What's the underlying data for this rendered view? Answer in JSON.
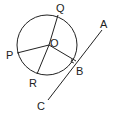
{
  "diagram": {
    "type": "geometry",
    "colors": {
      "stroke": "#222222",
      "background": "#ffffff"
    },
    "labels": {
      "Q": "Q",
      "O": "O",
      "P": "P",
      "R": "R",
      "B": "B",
      "A": "A",
      "C": "C"
    }
  }
}
